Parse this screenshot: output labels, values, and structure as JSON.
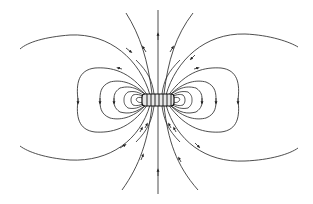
{
  "diagram": {
    "title": "Magnetic field lines around a solenoid (bar magnet)",
    "subject": "solenoid",
    "elements": {
      "source": {
        "type": "solenoid",
        "center": [
          158,
          100
        ],
        "width": 32,
        "height": 12,
        "turns": 6
      },
      "field_lines": {
        "count_approx": 24,
        "direction": "out of top/bottom poles, returning around sides",
        "arrow_markers": true
      },
      "colors": {
        "lines": "#3a3a3a",
        "background": "#ffffff",
        "coil_fill": "#e8e8e8"
      }
    }
  }
}
